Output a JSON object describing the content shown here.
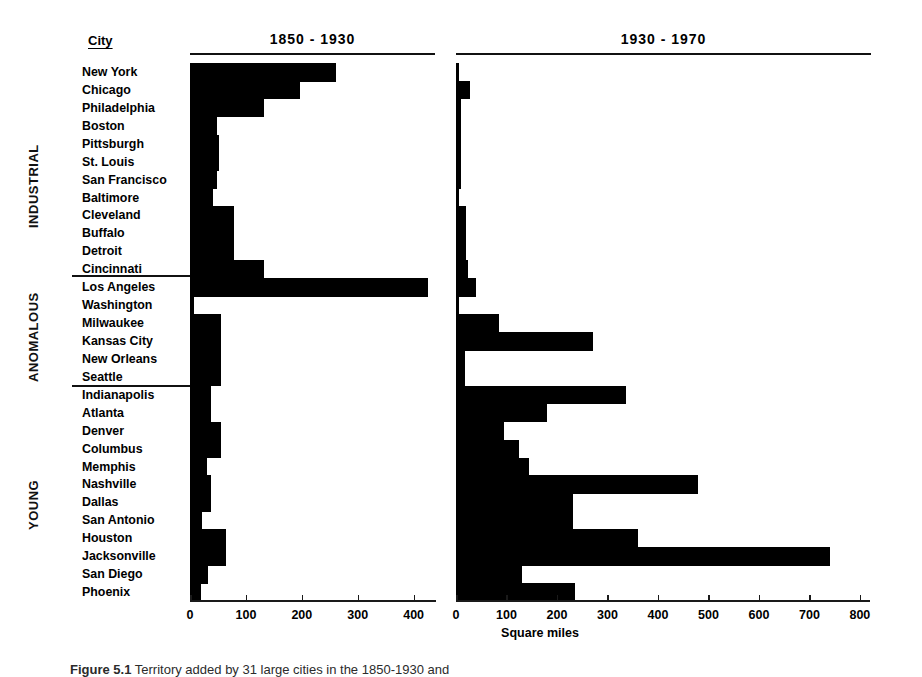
{
  "figure": {
    "city_column_header": "City",
    "axis_title": "Square miles",
    "caption_prefix": "Figure 5.1",
    "caption_text": "Territory added by 31 large cities in the 1850-1930 and",
    "groups": [
      {
        "name": "INDUSTRIAL",
        "label": "INDUSTRIAL"
      },
      {
        "name": "ANOMALOUS",
        "label": "ANOMALOUS"
      },
      {
        "name": "YOUNG",
        "label": "YOUNG"
      }
    ]
  },
  "chart_data": {
    "type": "bar",
    "orientation": "horizontal",
    "title": "Territory added by 31 large cities",
    "xlabel": "Square miles",
    "ylabel": "City",
    "grid": false,
    "legend": "none",
    "panels": [
      {
        "label": "1850 - 1930",
        "xlim": [
          0,
          440
        ],
        "ticks": [
          0,
          100,
          200,
          300,
          400
        ],
        "tick_labels": [
          "0",
          "100",
          "200",
          "300",
          "400"
        ]
      },
      {
        "label": "1930 - 1970",
        "xlim": [
          0,
          820
        ],
        "ticks": [
          0,
          100,
          200,
          300,
          400,
          500,
          600,
          700,
          800
        ],
        "tick_labels": [
          "0",
          "100",
          "200",
          "300",
          "400",
          "500",
          "600",
          "700",
          "800"
        ]
      }
    ],
    "categories": [
      "New York",
      "Chicago",
      "Philadelphia",
      "Boston",
      "Pittsburgh",
      "St. Louis",
      "San Francisco",
      "Baltimore",
      "Cleveland",
      "Buffalo",
      "Detroit",
      "Cincinnati",
      "Los Angeles",
      "Washington",
      "Milwaukee",
      "Kansas City",
      "New Orleans",
      "Seattle",
      "Indianapolis",
      "Atlanta",
      "Denver",
      "Columbus",
      "Memphis",
      "Nashville",
      "Dallas",
      "San Antonio",
      "Houston",
      "Jacksonville",
      "San Diego",
      "Phoenix"
    ],
    "group_of_category": [
      "INDUSTRIAL",
      "INDUSTRIAL",
      "INDUSTRIAL",
      "INDUSTRIAL",
      "INDUSTRIAL",
      "INDUSTRIAL",
      "INDUSTRIAL",
      "INDUSTRIAL",
      "INDUSTRIAL",
      "INDUSTRIAL",
      "INDUSTRIAL",
      "INDUSTRIAL",
      "ANOMALOUS",
      "ANOMALOUS",
      "ANOMALOUS",
      "ANOMALOUS",
      "ANOMALOUS",
      "ANOMALOUS",
      "YOUNG",
      "YOUNG",
      "YOUNG",
      "YOUNG",
      "YOUNG",
      "YOUNG",
      "YOUNG",
      "YOUNG",
      "YOUNG",
      "YOUNG",
      "YOUNG",
      "YOUNG"
    ],
    "series": [
      {
        "name": "1850 - 1930",
        "values": [
          262,
          196,
          132,
          48,
          52,
          52,
          48,
          42,
          78,
          78,
          78,
          132,
          425,
          8,
          56,
          56,
          56,
          56,
          38,
          38,
          56,
          56,
          30,
          38,
          38,
          22,
          64,
          64,
          32,
          20
        ]
      },
      {
        "name": "1930 - 1970",
        "values": [
          6,
          28,
          10,
          10,
          10,
          10,
          10,
          6,
          20,
          20,
          20,
          24,
          40,
          0,
          86,
          272,
          18,
          18,
          336,
          180,
          96,
          124,
          145,
          480,
          232,
          232,
          360,
          740,
          130,
          235
        ]
      }
    ]
  }
}
